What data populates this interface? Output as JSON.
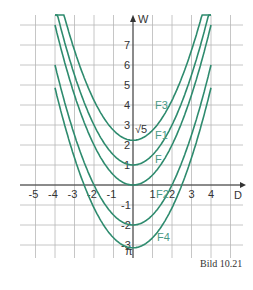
{
  "chart_data": {
    "type": "line",
    "title": "",
    "caption": "Bild 10.21",
    "xlabel": "D",
    "ylabel": "W",
    "xlim": [
      -5.5,
      5.5
    ],
    "ylim": [
      -3.6,
      8.5
    ],
    "grid": true,
    "x_ticks": [
      "-5",
      "-4",
      "-3",
      "-2",
      "-1",
      "1",
      "2",
      "3",
      "4"
    ],
    "y_ticks": [
      "-3",
      "-2",
      "-1",
      "1",
      "2",
      "3",
      "4",
      "5",
      "6",
      "7"
    ],
    "annotations": [
      "√5",
      "π"
    ],
    "series": [
      {
        "name": "F3",
        "formula": "W = 0.5·D² + √5",
        "vertex": [
          0,
          2.236
        ]
      },
      {
        "name": "F1",
        "formula": "W = 0.5·D² + 1",
        "vertex": [
          0,
          1
        ]
      },
      {
        "name": "F",
        "formula": "W = 0.5·D²",
        "vertex": [
          0,
          0
        ]
      },
      {
        "name": "F2",
        "formula": "W = 0.5·D² - 2",
        "vertex": [
          0,
          -2
        ]
      },
      {
        "name": "F4",
        "formula": "W = 0.5·D² - π",
        "vertex": [
          0,
          -3.1416
        ]
      }
    ],
    "x_range": [
      -4,
      4
    ],
    "line_color": "#2e8b6e"
  },
  "labels": {
    "F3": "F3",
    "F1": "F1",
    "F": "F",
    "F2": "F2",
    "F4": "F4",
    "sqrt5": "√5",
    "pi": "π",
    "xaxis": "D",
    "yaxis": "W",
    "caption": "Bild 10.21"
  }
}
